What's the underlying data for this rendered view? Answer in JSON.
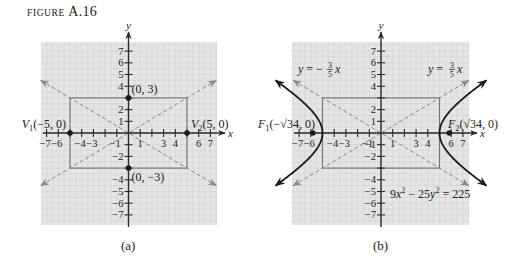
{
  "figure": {
    "label_prefix": "FIGURE",
    "label_number": "A.16"
  },
  "style": {
    "plot_bg": "#e5e5e5",
    "grid_color": "#d2d2d2",
    "axis_color": "#2a2a2a",
    "rect_color": "#777777",
    "asymptote_color": "#888888",
    "curve_color": "#1a1a1a",
    "text_color": "#222222"
  },
  "chart_data": [
    {
      "id": "a",
      "type": "line",
      "caption": "(a)",
      "xlabel": "x",
      "ylabel": "y",
      "xlim": [
        -7.5,
        7.5
      ],
      "ylim": [
        -7.8,
        7.8
      ],
      "grid": true,
      "x_ticks": [
        -7,
        -6,
        -5,
        -4,
        -3,
        -2,
        -1,
        1,
        2,
        3,
        4,
        5,
        6,
        7
      ],
      "x_tick_labels": [
        {
          "v": -7,
          "t": "−7"
        },
        {
          "v": -6,
          "t": "−6"
        },
        {
          "v": -4,
          "t": "−4"
        },
        {
          "v": -3,
          "t": "−3"
        },
        {
          "v": -1,
          "t": "−1"
        },
        {
          "v": 1,
          "t": "1"
        },
        {
          "v": 3,
          "t": "3"
        },
        {
          "v": 4,
          "t": "4"
        },
        {
          "v": 6,
          "t": "6"
        },
        {
          "v": 7,
          "t": "7"
        }
      ],
      "y_ticks": [
        -7,
        -6,
        -5,
        -4,
        -3,
        -2,
        -1,
        1,
        2,
        3,
        4,
        5,
        6,
        7
      ],
      "y_tick_labels": [
        {
          "v": 7,
          "t": "7"
        },
        {
          "v": 6,
          "t": "6"
        },
        {
          "v": 5,
          "t": "5"
        },
        {
          "v": 4,
          "t": "4"
        },
        {
          "v": 2,
          "t": "2"
        },
        {
          "v": 1,
          "t": "1"
        },
        {
          "v": -2,
          "t": "−2"
        },
        {
          "v": -4,
          "t": "−4"
        },
        {
          "v": -5,
          "t": "−5"
        },
        {
          "v": -6,
          "t": "−6"
        },
        {
          "v": -7,
          "t": "−7"
        }
      ],
      "rectangle": {
        "x": [
          -5,
          5
        ],
        "y": [
          -3,
          3
        ]
      },
      "asymptotes": [
        {
          "slope": 0.6,
          "x_range": [
            -7.5,
            7.5
          ]
        },
        {
          "slope": -0.6,
          "x_range": [
            -7.5,
            7.5
          ]
        }
      ],
      "points": [
        {
          "x": -5,
          "y": 0,
          "label": "V₁(−5, 0)",
          "label_main": "V",
          "label_sub": "1",
          "label_rest": "(−5, 0)",
          "anchor": "end",
          "dx": -4,
          "dy": -5
        },
        {
          "x": 5,
          "y": 0,
          "label": "V₂(5, 0)",
          "label_main": "V",
          "label_sub": "2",
          "label_rest": "(5, 0)",
          "anchor": "start",
          "dx": 4,
          "dy": -5
        },
        {
          "x": 0,
          "y": 3,
          "label": "(0, 3)",
          "label_main": "",
          "label_sub": "",
          "label_rest": "(0, 3)",
          "anchor": "start",
          "dx": 3,
          "dy": -5
        },
        {
          "x": 0,
          "y": -3,
          "label": "(0, −3)",
          "label_main": "",
          "label_sub": "",
          "label_rest": "(0, −3)",
          "anchor": "start",
          "dx": 3,
          "dy": 13
        }
      ],
      "hyperbola": null,
      "annotations": []
    },
    {
      "id": "b",
      "type": "line",
      "caption": "(b)",
      "xlabel": "x",
      "ylabel": "y",
      "xlim": [
        -7.5,
        7.5
      ],
      "ylim": [
        -7.8,
        7.8
      ],
      "grid": true,
      "x_ticks": [
        -7,
        -6,
        -5,
        -4,
        -3,
        -2,
        -1,
        1,
        2,
        3,
        4,
        5,
        6,
        7
      ],
      "x_tick_labels": [
        {
          "v": -7,
          "t": "−7"
        },
        {
          "v": -6,
          "t": "−6"
        },
        {
          "v": -4,
          "t": "−4"
        },
        {
          "v": -3,
          "t": "−3"
        },
        {
          "v": -1,
          "t": "−1"
        },
        {
          "v": 1,
          "t": "1"
        },
        {
          "v": 3,
          "t": "3"
        },
        {
          "v": 4,
          "t": "4"
        },
        {
          "v": 6,
          "t": "6"
        },
        {
          "v": 7,
          "t": "7"
        }
      ],
      "y_ticks": [
        -7,
        -6,
        -5,
        -4,
        -3,
        -2,
        -1,
        1,
        2,
        3,
        4,
        5,
        6,
        7
      ],
      "y_tick_labels": [
        {
          "v": 7,
          "t": "7"
        },
        {
          "v": 6,
          "t": "6"
        },
        {
          "v": 5,
          "t": "5"
        },
        {
          "v": 4,
          "t": "4"
        },
        {
          "v": 2,
          "t": "2"
        },
        {
          "v": 1,
          "t": "1"
        },
        {
          "v": -1,
          "t": "−1"
        },
        {
          "v": -2,
          "t": "−2"
        },
        {
          "v": -4,
          "t": "−4"
        },
        {
          "v": -5,
          "t": "−5"
        },
        {
          "v": -6,
          "t": "−6"
        },
        {
          "v": -7,
          "t": "−7"
        }
      ],
      "rectangle": {
        "x": [
          -5,
          5
        ],
        "y": [
          -3,
          3
        ]
      },
      "asymptotes": [
        {
          "slope": 0.6,
          "x_range": [
            -7.5,
            7.5
          ],
          "label": "y = (3/5)x"
        },
        {
          "slope": -0.6,
          "x_range": [
            -7.5,
            7.5
          ],
          "label": "y = −(3/5)x"
        }
      ],
      "hyperbola": {
        "equation": "9x² − 25y² = 225",
        "a": 5,
        "b": 3,
        "y_extent": 4.5
      },
      "foci": [
        {
          "x": -5.83,
          "y": 0,
          "label": "F₁(−√34, 0)",
          "label_main": "F",
          "label_sub": "1",
          "label_rest": "(−√34, 0)"
        },
        {
          "x": 5.83,
          "y": 0,
          "label": "F₂(√34, 0)",
          "label_main": "F",
          "label_sub": "2",
          "label_rest": "(√34, 0)"
        }
      ],
      "annotations": [
        {
          "text": "y = −(3/5)x",
          "kind": "asymptote-left"
        },
        {
          "text": "y = (3/5)x",
          "kind": "asymptote-right"
        },
        {
          "text": "9x² − 25y² = 225",
          "kind": "equation"
        }
      ]
    }
  ],
  "panels_layout": [
    {
      "id": "a",
      "left": 41,
      "top": 42,
      "right": 217,
      "bottom": 225,
      "origin_x": 128.5,
      "origin_y": 133,
      "scale": 11.7,
      "caption_x": 129,
      "caption_y": 238
    },
    {
      "id": "b",
      "left": 292,
      "top": 42,
      "right": 469,
      "bottom": 225,
      "origin_x": 381,
      "origin_y": 133,
      "scale": 11.7,
      "caption_x": 381,
      "caption_y": 238
    }
  ]
}
